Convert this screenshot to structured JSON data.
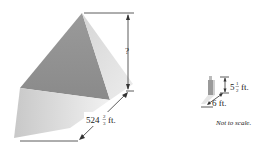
{
  "figure": {
    "pyramid": {
      "height_label": "?",
      "base_label_whole": "524",
      "base_label_num": "2",
      "base_label_den": "3",
      "base_label_unit": "ft."
    },
    "person": {
      "height_label_whole": "5",
      "height_label_num": "1",
      "height_label_den": "2",
      "height_label_unit": "ft.",
      "shadow_label": "6 ft."
    },
    "note": "Not to scale."
  }
}
